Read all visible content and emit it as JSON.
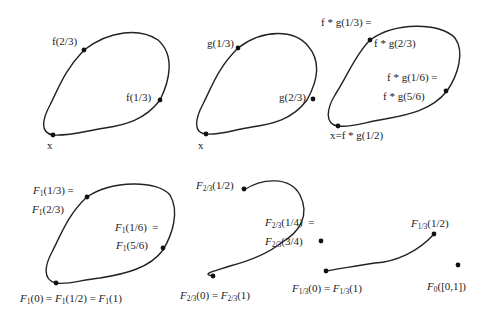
{
  "figure": {
    "panels": [
      {
        "id": "f-loop",
        "labels": {
          "top": "f(2/3)",
          "right": "f(1/3)",
          "base": "x"
        }
      },
      {
        "id": "g-loop",
        "labels": {
          "top": "g(1/3)",
          "right": "g(2/3)",
          "base": "x"
        }
      },
      {
        "id": "fg-loop",
        "labels": {
          "top_a": "f * g(1/3) =",
          "top_b": "f * g(2/3)",
          "right_a": "f * g(1/6) =",
          "right_b": "f * g(5/6)",
          "base": "x=f * g(1/2)"
        }
      },
      {
        "id": "F1-loop",
        "labels": {
          "top_a": "F1(1/3) =",
          "top_b": "F1(2/3)",
          "right_a": "F1(1/6) =",
          "right_b": "F1(5/6)",
          "base": "F1(0) = F1(1/2) = F1(1)"
        }
      },
      {
        "id": "F23-path",
        "labels": {
          "end": "F2/3(1/2)",
          "mid_a": "F2/3(1/4) =",
          "mid_b": "F2/3(3/4)",
          "base": "F2/3(0) = F2/3(1)"
        }
      },
      {
        "id": "F13-path",
        "labels": {
          "end": "F1/3(1/2)",
          "base": "F1/3(0) = F1/3(1)"
        }
      },
      {
        "id": "F0-point",
        "labels": {
          "base": "F0([0,1])"
        }
      }
    ],
    "stroke_color": "#222222",
    "background": "#ffffff"
  }
}
